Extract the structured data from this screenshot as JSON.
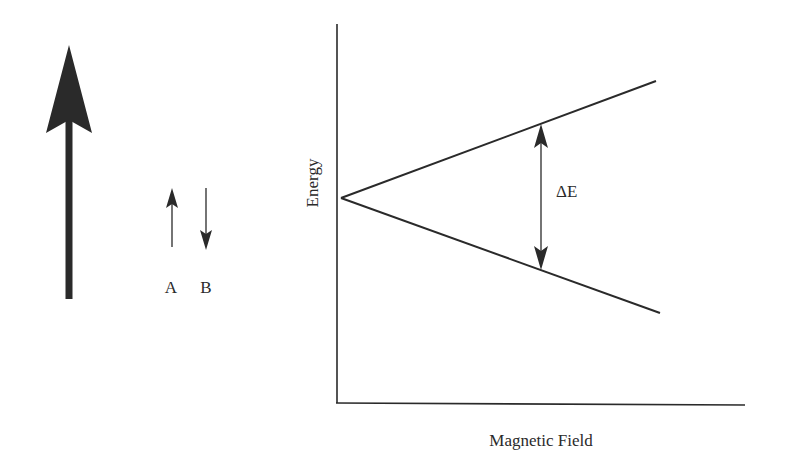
{
  "diagram": {
    "type": "zeeman-splitting",
    "colors": {
      "ink": "#2a2a2a",
      "background": "#ffffff"
    },
    "field_arrow": {
      "icon": "large-up-arrow-icon",
      "direction": "up"
    },
    "spin_states": [
      {
        "label": "A",
        "direction": "up",
        "icon": "small-up-arrow-icon"
      },
      {
        "label": "B",
        "direction": "down",
        "icon": "small-down-arrow-icon"
      }
    ],
    "graph": {
      "ylabel": "Energy",
      "xlabel": "Magnetic Field",
      "gap_label": "ΔE",
      "lines": [
        {
          "name": "upper-energy-level",
          "trend": "increasing"
        },
        {
          "name": "lower-energy-level",
          "trend": "decreasing"
        }
      ]
    }
  }
}
